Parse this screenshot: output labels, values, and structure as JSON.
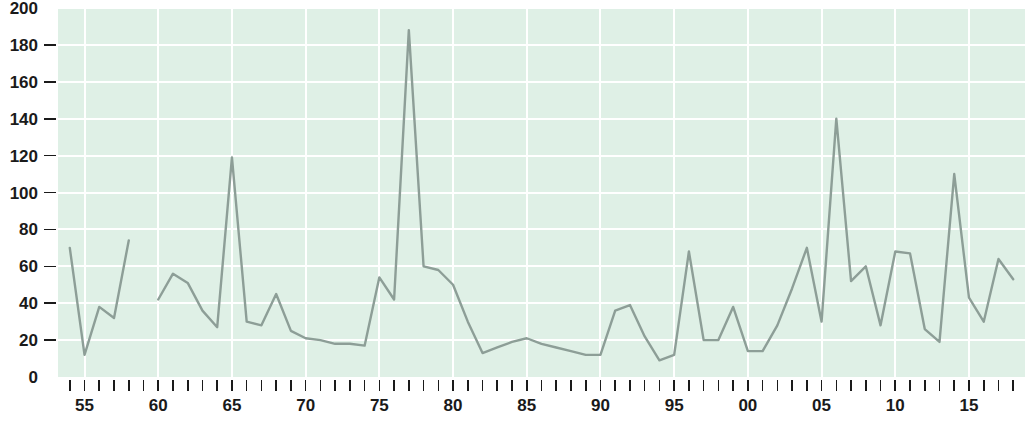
{
  "chart_data": {
    "type": "line",
    "title": "",
    "subtitle": "",
    "xlabel": "",
    "ylabel": "",
    "xlim": [
      1953.2,
      2018.8
    ],
    "ylim": [
      0,
      200
    ],
    "grid": true,
    "legend_position": "none",
    "y_ticks": [
      0,
      20,
      40,
      60,
      80,
      100,
      120,
      140,
      160,
      180,
      200
    ],
    "y_tick_labels": [
      "0",
      "20",
      "40",
      "60",
      "80",
      "100",
      "120",
      "140",
      "160",
      "180",
      "200"
    ],
    "x_tick_years": [
      1954,
      1955,
      1956,
      1957,
      1958,
      1959,
      1960,
      1961,
      1962,
      1963,
      1964,
      1965,
      1966,
      1967,
      1968,
      1969,
      1970,
      1971,
      1972,
      1973,
      1974,
      1975,
      1976,
      1977,
      1978,
      1979,
      1980,
      1981,
      1982,
      1983,
      1984,
      1985,
      1986,
      1987,
      1988,
      1989,
      1990,
      1991,
      1992,
      1993,
      1994,
      1995,
      1996,
      1997,
      1998,
      1999,
      2000,
      2001,
      2002,
      2003,
      2004,
      2005,
      2006,
      2007,
      2008,
      2009,
      2010,
      2011,
      2012,
      2013,
      2014,
      2015,
      2016,
      2017,
      2018
    ],
    "x_labeled_years": [
      1955,
      1960,
      1965,
      1970,
      1975,
      1980,
      1985,
      1990,
      1995,
      2000,
      2005,
      2010,
      2015
    ],
    "x_tick_labels": [
      "55",
      "60",
      "65",
      "70",
      "75",
      "80",
      "85",
      "90",
      "95",
      "00",
      "05",
      "10",
      "15"
    ],
    "x_gridline_years": [
      1955,
      1960,
      1965,
      1970,
      1975,
      1980,
      1985,
      1990,
      1995,
      2000,
      2005,
      2010,
      2015
    ],
    "series": [
      {
        "name": "series-1",
        "color": "#8d9e97",
        "segments": [
          {
            "x": [
              1954,
              1955,
              1956,
              1957,
              1958
            ],
            "values": [
              70,
              12,
              38,
              32,
              74
            ]
          },
          {
            "x": [
              1960,
              1961,
              1962,
              1963,
              1964,
              1965,
              1966,
              1967,
              1968,
              1969,
              1970,
              1971,
              1972,
              1973,
              1974,
              1975,
              1976,
              1977,
              1978,
              1979,
              1980,
              1981,
              1982,
              1983,
              1984,
              1985,
              1986,
              1987,
              1988,
              1989,
              1990,
              1991,
              1992,
              1993,
              1994,
              1995,
              1996,
              1997,
              1998,
              1999,
              2000,
              2001,
              2002,
              2003,
              2004,
              2005,
              2006,
              2007,
              2008,
              2009,
              2010,
              2011,
              2012,
              2013,
              2014,
              2015,
              2016,
              2017,
              2018
            ],
            "values": [
              42,
              56,
              51,
              36,
              27,
              119,
              30,
              28,
              45,
              25,
              21,
              20,
              18,
              18,
              17,
              54,
              42,
              188,
              60,
              58,
              50,
              30,
              13,
              16,
              19,
              21,
              18,
              16,
              14,
              12,
              12,
              36,
              39,
              22,
              9,
              12,
              68,
              20,
              20,
              38,
              14,
              14,
              28,
              48,
              70,
              30,
              140,
              52,
              60,
              28,
              68,
              67,
              26,
              19,
              110,
              43,
              30,
              64,
              53,
              28
            ]
          }
        ]
      }
    ],
    "colors": {
      "plot_background": "#dff0e6",
      "gridline": "#ffffff",
      "line": "#8d9e97",
      "tick_text": "#1a1a1a",
      "page_background": "#ffffff"
    }
  },
  "footer": {
    "caption": ""
  }
}
